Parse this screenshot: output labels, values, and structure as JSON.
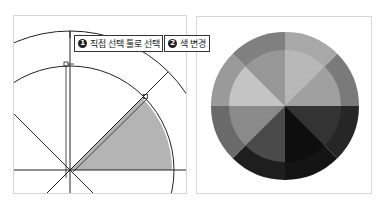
{
  "callouts": [
    {
      "number": "1",
      "label": "직접 선택 툴로 선택"
    },
    {
      "number": "2",
      "label": "색 변경"
    }
  ],
  "left_diagram": {
    "center": [
      56,
      154
    ],
    "outer_radius": 139,
    "inner_radius": 104,
    "spokes_deg": [
      0,
      45,
      90,
      135
    ],
    "selected_wedge": {
      "from_deg": 45,
      "to_deg": 90,
      "fill": "#b4b4b4"
    },
    "line_color": "#222222"
  },
  "right_wheel": {
    "center": [
      88,
      89
    ],
    "outer_radius": 74,
    "inner_radius": 56,
    "sectors": [
      {
        "start_deg": 0,
        "outer": "#a8a8a8",
        "inner": "#b8b8b8"
      },
      {
        "start_deg": 45,
        "outer": "#7a7a7a",
        "inner": "#a0a0a0"
      },
      {
        "start_deg": 90,
        "outer": "#262626",
        "inner": "#333333"
      },
      {
        "start_deg": 135,
        "outer": "#141414",
        "inner": "#0e0e0e"
      },
      {
        "start_deg": 180,
        "outer": "#1e1e1e",
        "inner": "#4a4a4a"
      },
      {
        "start_deg": 225,
        "outer": "#6a6a6a",
        "inner": "#8a8a8a"
      },
      {
        "start_deg": 270,
        "outer": "#9a9a9a",
        "inner": "#c4c4c4"
      },
      {
        "start_deg": 315,
        "outer": "#808080",
        "inner": "#989898"
      }
    ]
  },
  "colors": {
    "panel_border": "#d6d6d6",
    "callout_border": "#333333"
  }
}
